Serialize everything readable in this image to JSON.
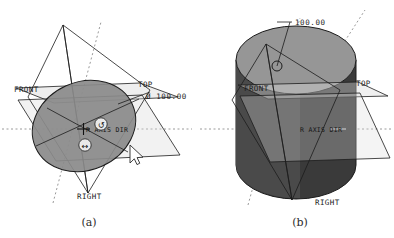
{
  "figure": {
    "caption_a": "(a)",
    "caption_b": "(b)",
    "background_color": "#ffffff",
    "line_color": "#1c1c1c",
    "axis_color": "#9a9a9a"
  },
  "panel_a": {
    "name": "circle-sketch-on-datum-planes",
    "labels": {
      "front": "FRONT",
      "top": "TOP",
      "right": "RIGHT",
      "diameter": "Ø 100.00",
      "axis_text": "R AXIS DIR"
    },
    "shape": {
      "kind": "ellipse",
      "fill_color": "#8a8a8a",
      "stroke_color": "#1c1c1c"
    },
    "plane_fill": "#d9d9d9",
    "handles": [
      {
        "name": "rotate-handle",
        "glyph": "↺"
      },
      {
        "name": "move-handle",
        "glyph": "↔"
      }
    ],
    "cursor": {
      "name": "mouse-cursor",
      "glyph": "➤"
    }
  },
  "panel_b": {
    "name": "extruded-cylinder-on-datum-planes",
    "labels": {
      "front": "FRONT",
      "top": "TOP",
      "right": "RIGHT",
      "dimension": "100.00",
      "axis_text": "R AXIS DIR"
    },
    "shape": {
      "kind": "cylinder",
      "top_face_color": "#969696",
      "body_color": "#3a3a3a",
      "stroke_color": "#1c1c1c"
    },
    "plane_fill": "#d9d9d9",
    "drag_dot": {
      "name": "extrude-drag-handle"
    }
  }
}
